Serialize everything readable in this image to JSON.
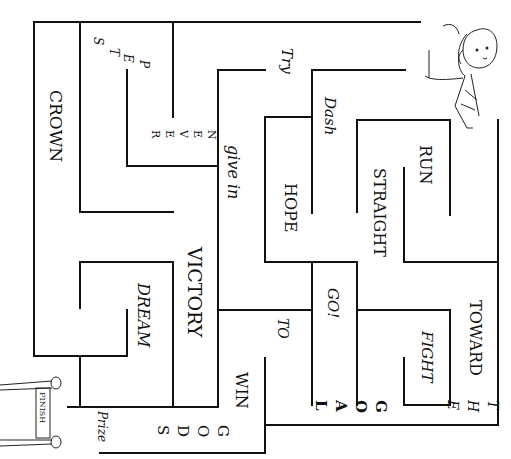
{
  "puzzle": {
    "type": "word-maze",
    "orientation": "rotated-90-clockwise"
  },
  "words": {
    "crown": "CROWN",
    "steps": [
      "S",
      "T",
      "E",
      "P"
    ],
    "never": [
      "N",
      "E",
      "V",
      "E",
      "R"
    ],
    "try": "Try",
    "give_in": "give in",
    "dash": "Dash",
    "hope": "HOPE",
    "run": "RUN",
    "straight": "STRAIGHT",
    "victory": "VICTORY",
    "dream": "DREAM",
    "go": "GO!",
    "to": "TO",
    "toward": "TOWARD",
    "fight": "FIGHT",
    "the": [
      "T",
      "H",
      "E"
    ],
    "goal": [
      "G",
      "O",
      "A",
      "L"
    ],
    "win": "WIN",
    "gods": [
      "G",
      "O",
      "D",
      "S"
    ],
    "prize": "Prize",
    "finish": "FINISH"
  },
  "icons": {
    "start": "runner-girl-drawing",
    "end": "finish-line-banner"
  },
  "colors": {
    "ink": "#111111",
    "paper": "#ffffff"
  }
}
